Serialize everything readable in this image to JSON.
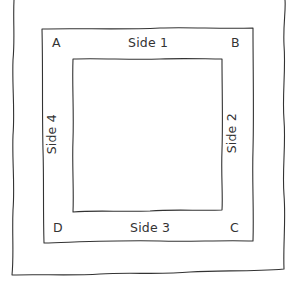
{
  "diagram": {
    "corners": {
      "a": "A",
      "b": "B",
      "c": "C",
      "d": "D"
    },
    "sides": {
      "side1": "Side 1",
      "side2": "Side 2",
      "side3": "Side 3",
      "side4": "Side 4"
    },
    "colors": {
      "stroke": "#333333",
      "text": "#333333",
      "background": "#ffffff"
    }
  }
}
